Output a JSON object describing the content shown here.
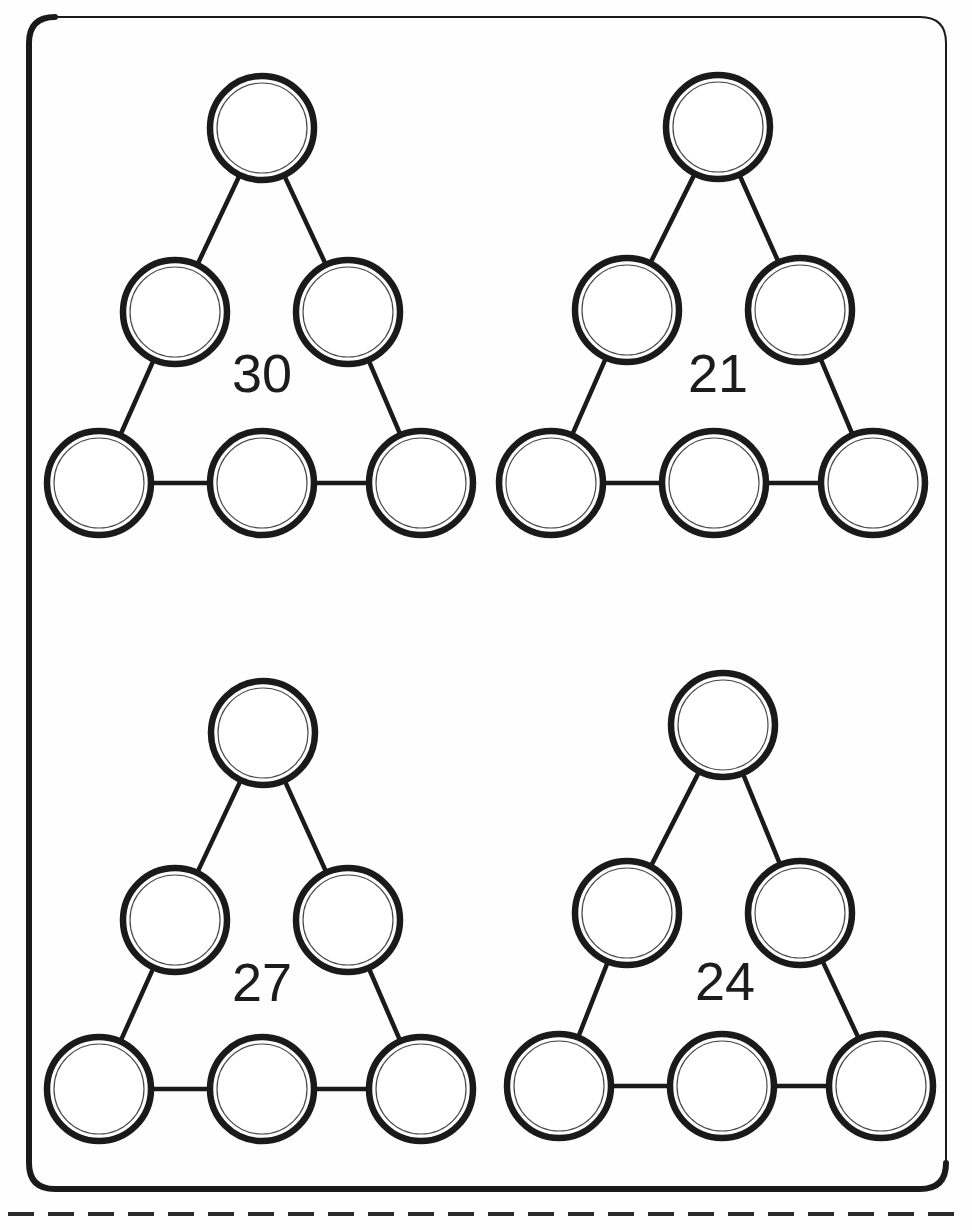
{
  "page": {
    "background_color": "#ffffff",
    "ink_color": "#1a1a1a",
    "width": 972,
    "height": 1230
  },
  "frame": {
    "name": "worksheet-border",
    "shape": "rounded-rectangle",
    "x": 29,
    "y": 17,
    "width": 917,
    "height": 1172,
    "corner_radius": 26,
    "thick_stroke": 6,
    "thin_stroke": 2
  },
  "cut_line": {
    "name": "dashed-cut-line",
    "y": 1214,
    "x_start": 8,
    "x_end": 966,
    "dash": "26 14",
    "stroke_width": 4
  },
  "puzzles": [
    {
      "id": "puzzle-1",
      "sum_label": "30",
      "label_x": 262,
      "label_y": 378,
      "node_radius": 52,
      "nodes": [
        {
          "id": "apex",
          "name": "circle-apex",
          "cx": 262,
          "cy": 128,
          "value": ""
        },
        {
          "id": "mid-left",
          "name": "circle-mid-left",
          "cx": 175,
          "cy": 312,
          "value": ""
        },
        {
          "id": "mid-right",
          "name": "circle-mid-right",
          "cx": 348,
          "cy": 312,
          "value": ""
        },
        {
          "id": "bottom-left",
          "name": "circle-bottom-left",
          "cx": 99,
          "cy": 483,
          "value": ""
        },
        {
          "id": "bottom-mid",
          "name": "circle-bottom-mid",
          "cx": 262,
          "cy": 483,
          "value": ""
        },
        {
          "id": "bottom-right",
          "name": "circle-bottom-right",
          "cx": 421,
          "cy": 483,
          "value": ""
        }
      ],
      "edges": [
        [
          "apex",
          "mid-left"
        ],
        [
          "apex",
          "mid-right"
        ],
        [
          "mid-left",
          "bottom-left"
        ],
        [
          "mid-right",
          "bottom-right"
        ],
        [
          "bottom-left",
          "bottom-mid"
        ],
        [
          "bottom-mid",
          "bottom-right"
        ]
      ]
    },
    {
      "id": "puzzle-2",
      "sum_label": "21",
      "label_x": 718,
      "label_y": 378,
      "node_radius": 52,
      "nodes": [
        {
          "id": "apex",
          "name": "circle-apex",
          "cx": 718,
          "cy": 127,
          "value": ""
        },
        {
          "id": "mid-left",
          "name": "circle-mid-left",
          "cx": 627,
          "cy": 310,
          "value": ""
        },
        {
          "id": "mid-right",
          "name": "circle-mid-right",
          "cx": 800,
          "cy": 310,
          "value": ""
        },
        {
          "id": "bottom-left",
          "name": "circle-bottom-left",
          "cx": 551,
          "cy": 483,
          "value": ""
        },
        {
          "id": "bottom-mid",
          "name": "circle-bottom-mid",
          "cx": 714,
          "cy": 483,
          "value": ""
        },
        {
          "id": "bottom-right",
          "name": "circle-bottom-right",
          "cx": 873,
          "cy": 483,
          "value": ""
        }
      ],
      "edges": [
        [
          "apex",
          "mid-left"
        ],
        [
          "apex",
          "mid-right"
        ],
        [
          "mid-left",
          "bottom-left"
        ],
        [
          "mid-right",
          "bottom-right"
        ],
        [
          "bottom-left",
          "bottom-mid"
        ],
        [
          "bottom-mid",
          "bottom-right"
        ]
      ]
    },
    {
      "id": "puzzle-3",
      "sum_label": "27",
      "label_x": 262,
      "label_y": 987,
      "node_radius": 52,
      "nodes": [
        {
          "id": "apex",
          "name": "circle-apex",
          "cx": 263,
          "cy": 733,
          "value": ""
        },
        {
          "id": "mid-left",
          "name": "circle-mid-left",
          "cx": 175,
          "cy": 920,
          "value": ""
        },
        {
          "id": "mid-right",
          "name": "circle-mid-right",
          "cx": 348,
          "cy": 920,
          "value": ""
        },
        {
          "id": "bottom-left",
          "name": "circle-bottom-left",
          "cx": 99,
          "cy": 1089,
          "value": ""
        },
        {
          "id": "bottom-mid",
          "name": "circle-bottom-mid",
          "cx": 262,
          "cy": 1089,
          "value": ""
        },
        {
          "id": "bottom-right",
          "name": "circle-bottom-right",
          "cx": 421,
          "cy": 1089,
          "value": ""
        }
      ],
      "edges": [
        [
          "apex",
          "mid-left"
        ],
        [
          "apex",
          "mid-right"
        ],
        [
          "mid-left",
          "bottom-left"
        ],
        [
          "mid-right",
          "bottom-right"
        ],
        [
          "bottom-left",
          "bottom-mid"
        ],
        [
          "bottom-mid",
          "bottom-right"
        ]
      ]
    },
    {
      "id": "puzzle-4",
      "sum_label": "24",
      "label_x": 725,
      "label_y": 986,
      "node_radius": 52,
      "nodes": [
        {
          "id": "apex",
          "name": "circle-apex",
          "cx": 723,
          "cy": 725,
          "value": ""
        },
        {
          "id": "mid-left",
          "name": "circle-mid-left",
          "cx": 627,
          "cy": 913,
          "value": ""
        },
        {
          "id": "mid-right",
          "name": "circle-mid-right",
          "cx": 800,
          "cy": 913,
          "value": ""
        },
        {
          "id": "bottom-left",
          "name": "circle-bottom-left",
          "cx": 559,
          "cy": 1086,
          "value": ""
        },
        {
          "id": "bottom-mid",
          "name": "circle-bottom-mid",
          "cx": 722,
          "cy": 1086,
          "value": ""
        },
        {
          "id": "bottom-right",
          "name": "circle-bottom-right",
          "cx": 881,
          "cy": 1086,
          "value": ""
        }
      ],
      "edges": [
        [
          "apex",
          "mid-left"
        ],
        [
          "apex",
          "mid-right"
        ],
        [
          "mid-left",
          "bottom-left"
        ],
        [
          "mid-right",
          "bottom-right"
        ],
        [
          "bottom-left",
          "bottom-mid"
        ],
        [
          "bottom-mid",
          "bottom-right"
        ]
      ]
    }
  ]
}
